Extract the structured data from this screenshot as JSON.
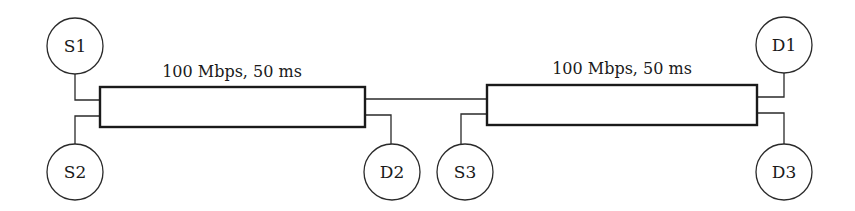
{
  "diagram": {
    "type": "network-topology",
    "links": [
      {
        "id": "link-1",
        "label": "100 Mbps, 50 ms"
      },
      {
        "id": "link-2",
        "label": "100 Mbps, 50 ms"
      }
    ],
    "nodes": [
      {
        "id": "S1",
        "label": "S1",
        "role": "source"
      },
      {
        "id": "S2",
        "label": "S2",
        "role": "source"
      },
      {
        "id": "S3",
        "label": "S3",
        "role": "source"
      },
      {
        "id": "D1",
        "label": "D1",
        "role": "destination"
      },
      {
        "id": "D2",
        "label": "D2",
        "role": "destination"
      },
      {
        "id": "D3",
        "label": "D3",
        "role": "destination"
      }
    ],
    "connections": [
      {
        "from": "S1",
        "to": "link-1"
      },
      {
        "from": "S2",
        "to": "link-1"
      },
      {
        "from": "link-1",
        "to": "D2"
      },
      {
        "from": "link-1",
        "to": "link-2"
      },
      {
        "from": "S3",
        "to": "link-2"
      },
      {
        "from": "link-2",
        "to": "D1"
      },
      {
        "from": "link-2",
        "to": "D3"
      }
    ]
  }
}
